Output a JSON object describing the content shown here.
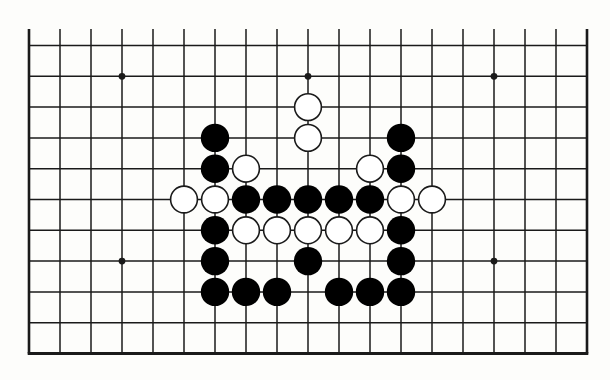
{
  "diagram": {
    "type": "go-board-fragment",
    "board_size": 19,
    "visible_columns": 19,
    "visible_rows": 11,
    "edges": {
      "left": true,
      "right": true,
      "bottom": true,
      "top": false
    },
    "colors": {
      "background": "#fdfdfb",
      "line": "#1a1a1a",
      "black_stone": "#000000",
      "white_stone_fill": "#ffffff",
      "white_stone_outline": "#1a1a1a"
    },
    "hoshi": [
      {
        "col": 3,
        "row": 1
      },
      {
        "col": 9,
        "row": 1
      },
      {
        "col": 15,
        "row": 1
      },
      {
        "col": 3,
        "row": 7
      },
      {
        "col": 15,
        "row": 7
      }
    ],
    "stones": {
      "black": [
        {
          "col": 6,
          "row": 3
        },
        {
          "col": 12,
          "row": 3
        },
        {
          "col": 6,
          "row": 4
        },
        {
          "col": 12,
          "row": 4
        },
        {
          "col": 7,
          "row": 5
        },
        {
          "col": 8,
          "row": 5
        },
        {
          "col": 9,
          "row": 5
        },
        {
          "col": 10,
          "row": 5
        },
        {
          "col": 11,
          "row": 5
        },
        {
          "col": 6,
          "row": 6
        },
        {
          "col": 12,
          "row": 6
        },
        {
          "col": 6,
          "row": 7
        },
        {
          "col": 9,
          "row": 7
        },
        {
          "col": 12,
          "row": 7
        },
        {
          "col": 6,
          "row": 8
        },
        {
          "col": 7,
          "row": 8
        },
        {
          "col": 8,
          "row": 8
        },
        {
          "col": 10,
          "row": 8
        },
        {
          "col": 11,
          "row": 8
        },
        {
          "col": 12,
          "row": 8
        }
      ],
      "white": [
        {
          "col": 9,
          "row": 2
        },
        {
          "col": 9,
          "row": 3
        },
        {
          "col": 7,
          "row": 4
        },
        {
          "col": 11,
          "row": 4
        },
        {
          "col": 5,
          "row": 5
        },
        {
          "col": 6,
          "row": 5
        },
        {
          "col": 12,
          "row": 5
        },
        {
          "col": 13,
          "row": 5
        },
        {
          "col": 7,
          "row": 6
        },
        {
          "col": 8,
          "row": 6
        },
        {
          "col": 9,
          "row": 6
        },
        {
          "col": 10,
          "row": 6
        },
        {
          "col": 11,
          "row": 6
        }
      ]
    }
  }
}
